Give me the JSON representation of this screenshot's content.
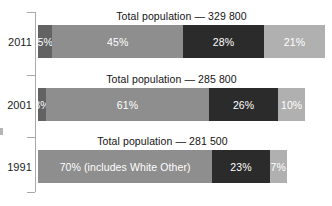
{
  "chart_data": {
    "type": "bar",
    "orientation": "horizontal",
    "stacked": true,
    "title": "",
    "xlabel": "",
    "ylabel": "",
    "grid": false,
    "legend_position": "none",
    "categories": [
      "2011",
      "2001",
      "1991"
    ],
    "rows": [
      {
        "category": "2011",
        "title": "Total population — 329 800",
        "total_population": 329800,
        "bar_top": 25,
        "bar_width": 287,
        "title_left": 38,
        "title_width": 287,
        "title_top": 10,
        "label_top": 36,
        "segments": [
          {
            "label": "5%",
            "value": 5,
            "color": "#636363"
          },
          {
            "label": "45%",
            "value": 45,
            "color": "#8e8e8e"
          },
          {
            "label": "28%",
            "value": 28,
            "color": "#2b2b2b"
          },
          {
            "label": "21%",
            "value": 21,
            "color": "#b0b0b0"
          }
        ]
      },
      {
        "category": "2001",
        "title": "Total population — 285 800",
        "total_population": 285800,
        "bar_top": 88,
        "bar_width": 267,
        "title_left": 38,
        "title_width": 267,
        "title_top": 73,
        "label_top": 99,
        "segments": [
          {
            "label": "3%",
            "value": 3,
            "color": "#636363"
          },
          {
            "label": "61%",
            "value": 61,
            "color": "#8e8e8e"
          },
          {
            "label": "26%",
            "value": 26,
            "color": "#2b2b2b"
          },
          {
            "label": "10%",
            "value": 10,
            "color": "#b0b0b0"
          }
        ]
      },
      {
        "category": "1991",
        "title": "Total population — 281 500",
        "total_population": 281500,
        "bar_top": 150,
        "bar_width": 249,
        "title_left": 38,
        "title_width": 249,
        "title_top": 135,
        "label_top": 161,
        "segments": [
          {
            "label": "70% (includes White Other)",
            "value": 70,
            "color": "#8e8e8e"
          },
          {
            "label": "23%",
            "value": 23,
            "color": "#2b2b2b"
          },
          {
            "label": "7%",
            "value": 7,
            "color": "#b0b0b0"
          }
        ]
      }
    ],
    "axis": {
      "ticks_y": [
        12,
        75,
        137,
        192
      ]
    },
    "colors": {
      "segment_dark_gray": "#636363",
      "segment_medium_gray": "#8e8e8e",
      "segment_near_black": "#2b2b2b",
      "segment_light_gray": "#b0b0b0",
      "axis": "#a9a9a9",
      "text": "#141414",
      "segment_text": "#ffffff",
      "background": "#ffffff"
    }
  }
}
